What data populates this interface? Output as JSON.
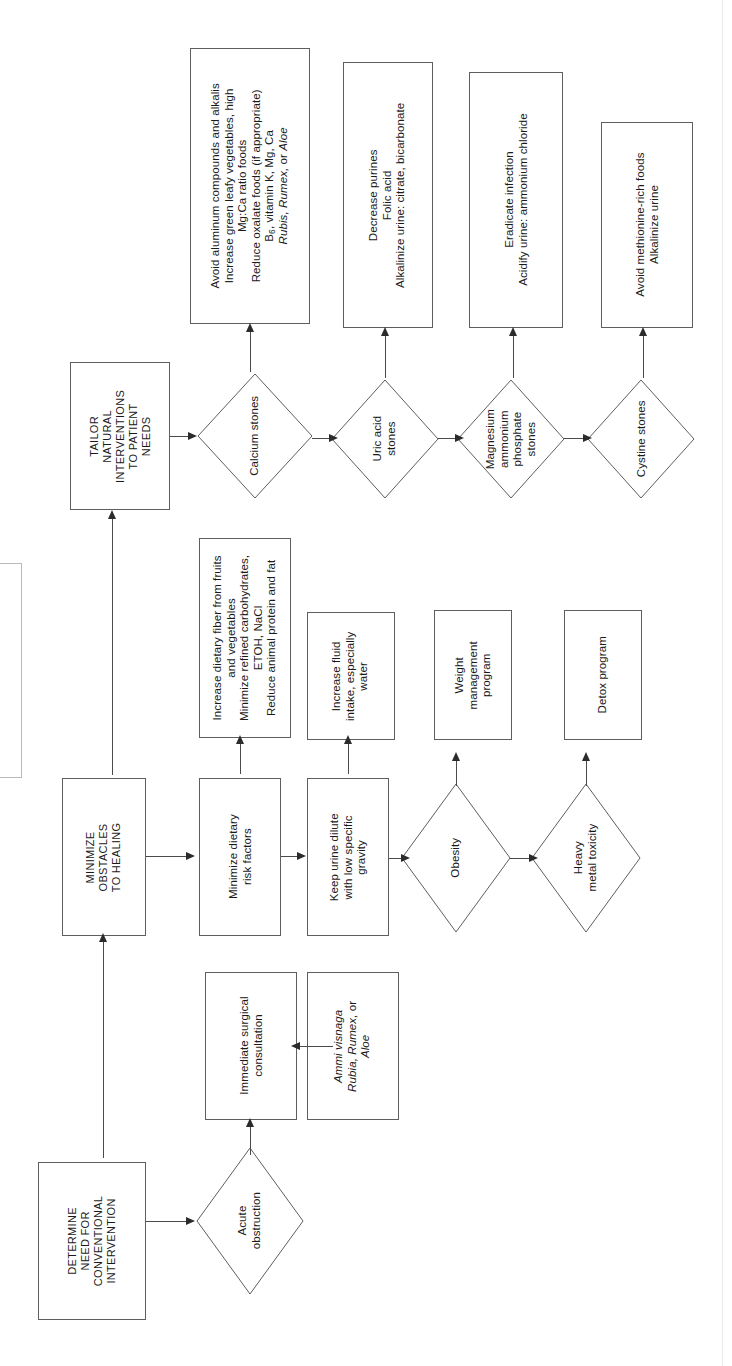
{
  "figure": {
    "orientation": "rotated-90-clockwise",
    "background": "#ffffff",
    "stroke_color": "#5e5e5e",
    "arrow_color": "#2b2b2b"
  },
  "stages": {
    "determine": "DETERMINE\nNEED FOR\nCONVENTIONAL\nINTERVENTION",
    "minimize": "MINIMIZE\nOBSTACLES\nTO HEALING",
    "tailor": "TAILOR\nNATURAL\nINTERVENTIONS\nTO PATIENT\nNEEDS"
  },
  "decisions": {
    "acute_obstruction": "Acute\nobstruction",
    "obesity": "Obesity",
    "heavy_metal": "Heavy\nmetal toxicity",
    "calcium_stones": "Calcium stones",
    "uric_acid_stones": "Uric acid\nstones",
    "map_stones": "Magnesium\nammonium\nphosphate\nstones",
    "cystine_stones": "Cystine stones"
  },
  "actions": {
    "surgical_consult": "Immediate surgical\nconsultation",
    "ammi": "Ammi visnaga\nRubia, Rumex, or\nAloe",
    "dietary_risk": "Minimize dietary\nrisk factors",
    "dietary_detail": "Increase dietary fiber from fruits\nand vegetables\nMinimize refined carbohydrates,\nETOH, NaCl\nReduce animal protein and fat",
    "urine_dilute": "Keep urine dilute\nwith low specific\ngravity",
    "fluid_intake": "Increase fluid\nintake, especially\nwater",
    "weight_program": "Weight\nmanagement\nprogram",
    "detox_program": "Detox program",
    "calcium_tx": "Avoid aluminum compounds and alkalis\nIncrease green leafy vegetables, high\nMg:Ca ratio foods\nReduce oxalate foods (if appropriate)\nB6, vitamin K, Mg, Ca\nRubis, Rumex, or Aloe",
    "uric_tx": "Decrease purines\nFolic acid\nAlkalinize urine: citrate, bicarbonate",
    "map_tx": "Eradicate infection\nAcidify urine: ammonium chloride",
    "cystine_tx": "Avoid methionine-rich foods\nAlkalinize urine"
  },
  "italic_terms": [
    "Ammi visnaga",
    "Rubia",
    "Rumex",
    "Aloe",
    "Rubis"
  ]
}
